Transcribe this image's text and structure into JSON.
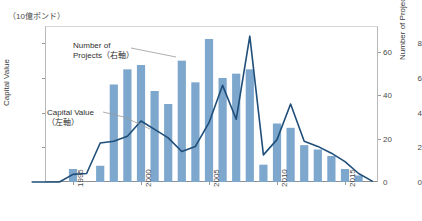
{
  "unit_label": "（10億ポンド）",
  "annotations": {
    "projects": "Number of\nProjects（右軸）",
    "capital": "Capital Value\n（左軸）"
  },
  "axes": {
    "left_title": "Capital Value",
    "right_title": "Number of Projects",
    "left_ticks": [
      "0",
      "2",
      "4",
      "6",
      "8"
    ],
    "right_ticks": [
      "0",
      "20",
      "40",
      "60"
    ],
    "x_ticks": [
      "1995",
      "2000",
      "2005",
      "2010",
      "2015"
    ]
  },
  "colors": {
    "bar": "#7da7cd",
    "line": "#1f4e79",
    "axis": "#8f8f8f",
    "text": "#3a3a3a"
  },
  "chart_data": {
    "type": "bar",
    "title": "",
    "subtitle": "",
    "xlabel": "",
    "ylabel": "Capital Value",
    "y2label": "Number of Projects",
    "unit": "（10億ポンド）",
    "ylim": [
      0,
      9.2
    ],
    "y2lim": [
      0,
      72
    ],
    "grid": false,
    "legend_position": "inline-annotations",
    "categories": [
      1992,
      1993,
      1994,
      1995,
      1996,
      1997,
      1998,
      1999,
      2000,
      2001,
      2002,
      2003,
      2004,
      2005,
      2006,
      2007,
      2008,
      2009,
      2010,
      2011,
      2012,
      2013,
      2014,
      2015,
      2016,
      2017
    ],
    "series": [
      {
        "name": "Number of Projects（右軸）",
        "axis": "right",
        "type": "bar",
        "values": [
          0,
          0,
          0,
          6,
          0,
          7.5,
          45,
          52,
          54,
          42,
          36,
          56,
          46,
          66,
          48,
          50,
          52,
          8,
          27,
          25,
          17,
          15,
          12,
          6,
          3,
          0
        ]
      },
      {
        "name": "Capital Value（左軸）",
        "axis": "left",
        "type": "line",
        "values": [
          0,
          0,
          0,
          0.45,
          0.5,
          2.3,
          2.4,
          2.7,
          3.6,
          3.1,
          2.6,
          1.8,
          2.1,
          3.5,
          5.7,
          3.7,
          8.6,
          1.6,
          2.5,
          4.6,
          2.4,
          2.1,
          1.7,
          1.2,
          0.5,
          0.05
        ]
      }
    ]
  }
}
